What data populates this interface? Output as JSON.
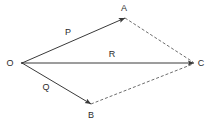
{
  "figure": {
    "kind": "vector-parallelogram-diagram",
    "width": 212,
    "height": 124,
    "background_color": "#ffffff",
    "stroke_color": "#3a3a3a",
    "dashed_stroke_color": "#6e6e6e",
    "label_color": "#2b2b2b"
  },
  "vertices": [
    {
      "id": "O",
      "label": "O",
      "x": 22,
      "y": 63,
      "label_x": 10,
      "label_y": 63
    },
    {
      "id": "A",
      "label": "A",
      "x": 125,
      "y": 18,
      "label_x": 124,
      "label_y": 8
    },
    {
      "id": "B",
      "label": "B",
      "x": 91,
      "y": 104,
      "label_x": 91,
      "label_y": 115
    },
    {
      "id": "C",
      "label": "C",
      "x": 194,
      "y": 63,
      "label_x": 201,
      "label_y": 63
    }
  ],
  "vectors": [
    {
      "id": "P",
      "label": "P",
      "from": "O",
      "to": "A",
      "style": "solid",
      "arrow": true,
      "x1": 22,
      "y1": 63,
      "x2": 125,
      "y2": 18,
      "label_x": 68,
      "label_y": 32
    },
    {
      "id": "R",
      "label": "R",
      "from": "O",
      "to": "C",
      "style": "solid",
      "arrow": true,
      "x1": 22,
      "y1": 63,
      "x2": 194,
      "y2": 63,
      "label_x": 112,
      "label_y": 54
    },
    {
      "id": "Q",
      "label": "Q",
      "from": "O",
      "to": "B",
      "style": "solid",
      "arrow": true,
      "x1": 22,
      "y1": 63,
      "x2": 91,
      "y2": 104,
      "label_x": 46,
      "label_y": 87
    }
  ],
  "construction_lines": [
    {
      "id": "AC",
      "from": "A",
      "to": "C",
      "style": "dashed",
      "arrow": false,
      "x1": 125,
      "y1": 18,
      "x2": 193,
      "y2": 62
    },
    {
      "id": "BC",
      "from": "B",
      "to": "C",
      "style": "dashed",
      "arrow": false,
      "x1": 91,
      "y1": 104,
      "x2": 193,
      "y2": 64
    }
  ]
}
